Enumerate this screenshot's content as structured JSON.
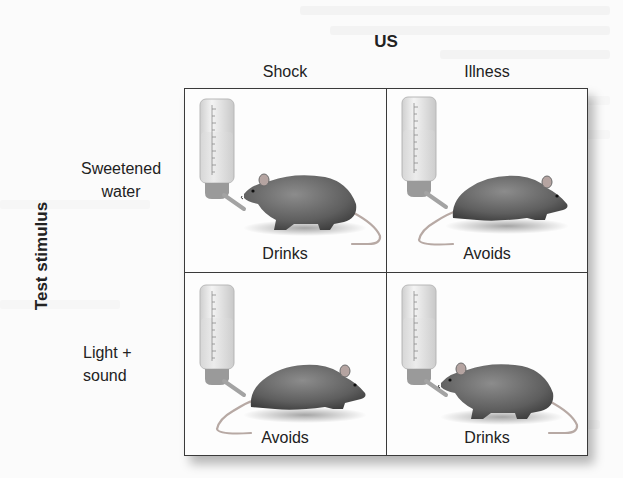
{
  "diagram": {
    "column_axis_title": "US",
    "row_axis_title": "Test stimulus",
    "columns": [
      {
        "label": "Shock"
      },
      {
        "label": "Illness"
      }
    ],
    "rows": [
      {
        "label_line1": "Sweetened",
        "label_line2": "water"
      },
      {
        "label_line1": "Light +",
        "label_line2": "sound"
      }
    ],
    "cells": [
      [
        {
          "outcome": "Drinks",
          "rat_pose": "drinking"
        },
        {
          "outcome": "Avoids",
          "rat_pose": "avoiding"
        }
      ],
      [
        {
          "outcome": "Avoids",
          "rat_pose": "avoiding"
        },
        {
          "outcome": "Drinks",
          "rat_pose": "drinking"
        }
      ]
    ],
    "icons": [
      "water-bottle-icon",
      "rat-icon"
    ]
  },
  "colors": {
    "grid_line": "#3a3a3a",
    "text": "#222222",
    "rat_body": "#6e6e6e",
    "bottle_fill": "#e6e6e6"
  }
}
